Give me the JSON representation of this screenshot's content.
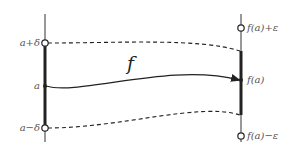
{
  "diagram": {
    "title": "",
    "function_label": "f",
    "left_axis": {
      "labels": {
        "upper": "a+δ",
        "center": "a",
        "lower": "a−δ"
      }
    },
    "right_axis": {
      "labels": {
        "upper": "f(a)+ε",
        "center": "f(a)",
        "lower": "f(a)−ε"
      }
    },
    "colors": {
      "line": "#222222",
      "label": "#555555",
      "background": "#ffffff"
    }
  }
}
